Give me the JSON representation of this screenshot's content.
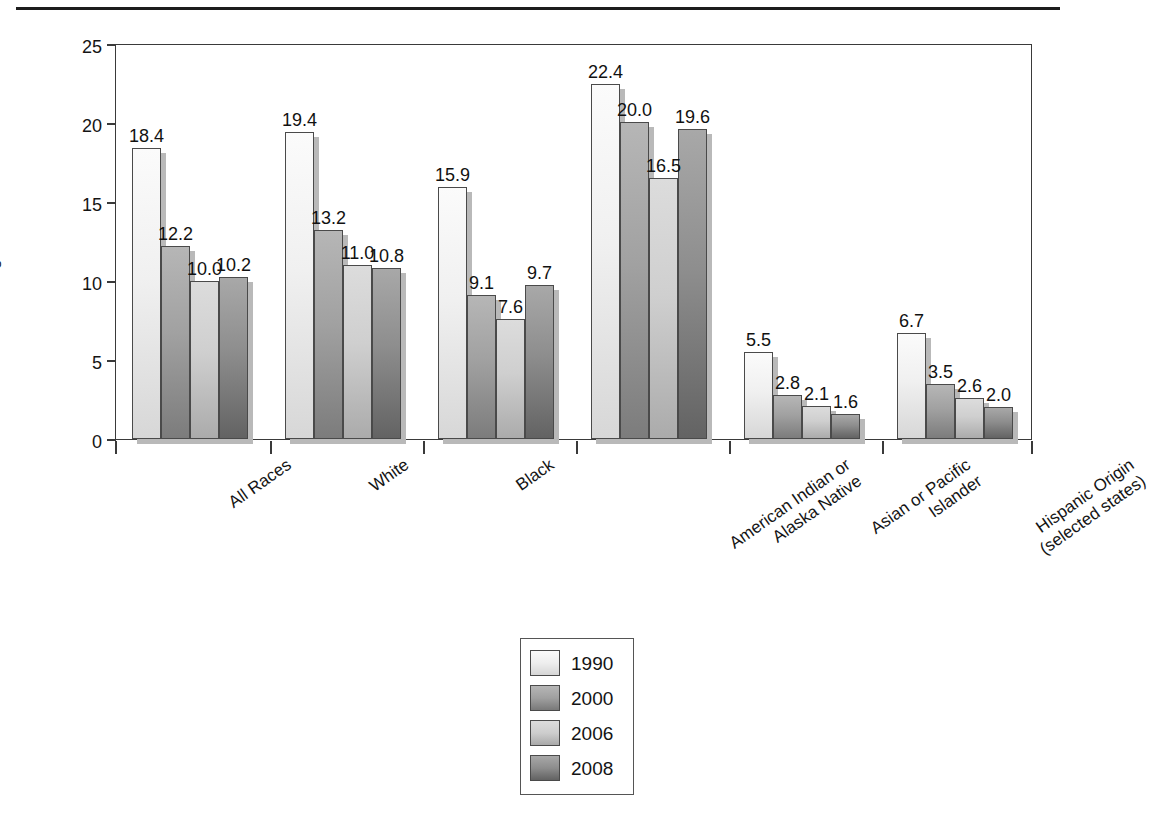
{
  "chart_data": {
    "type": "bar",
    "title": "",
    "xlabel": "",
    "ylabel": "Percentage of mothers who smoked",
    "ylim": [
      0,
      25
    ],
    "yticks": [
      0,
      5,
      10,
      15,
      20,
      25
    ],
    "grid": false,
    "legend_position": "bottom-center",
    "categories": [
      "All Races",
      "White",
      "Black",
      "American Indian or\nAlaska Native",
      "Asian or Pacific\nIslander",
      "Hispanic Origin\n(selected states)"
    ],
    "category_lines": [
      [
        "All Races"
      ],
      [
        "White"
      ],
      [
        "Black"
      ],
      [
        "American Indian or",
        "Alaska Native"
      ],
      [
        "Asian or Pacific",
        "Islander"
      ],
      [
        "Hispanic Origin",
        "(selected states)"
      ]
    ],
    "series": [
      {
        "name": "1990",
        "values": [
          18.4,
          19.4,
          15.9,
          22.4,
          5.5,
          6.7
        ],
        "color": "#f0f0f0"
      },
      {
        "name": "2000",
        "values": [
          12.2,
          13.2,
          9.1,
          20.0,
          2.8,
          3.5
        ],
        "color": "#a1a1a1"
      },
      {
        "name": "2006",
        "values": [
          10.0,
          11.0,
          7.6,
          16.5,
          2.1,
          2.6
        ],
        "color": "#cfcfcf"
      },
      {
        "name": "2008",
        "values": [
          10.2,
          10.8,
          9.7,
          19.6,
          1.6,
          2.0
        ],
        "color": "#8e8e8e"
      }
    ],
    "data_labels": [
      [
        "18.4",
        "12.2",
        "10.0",
        "10.2"
      ],
      [
        "19.4",
        "13.2",
        "11.0",
        "10.8"
      ],
      [
        "15.9",
        "9.1",
        "7.6",
        "9.7"
      ],
      [
        "22.4",
        "20.0",
        "16.5",
        "19.6"
      ],
      [
        "5.5",
        "2.8",
        "2.1",
        "1.6"
      ],
      [
        "6.7",
        "3.5",
        "2.6",
        "2.0"
      ]
    ]
  },
  "legend": {
    "entries": [
      "1990",
      "2000",
      "2006",
      "2008"
    ]
  },
  "axis": {
    "y_title": "Percentage of mothers who smoked",
    "y_ticks": [
      "25",
      "20",
      "15",
      "10",
      "5",
      "0"
    ]
  }
}
